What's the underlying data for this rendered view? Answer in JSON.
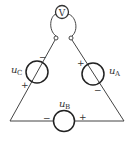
{
  "diagram": {
    "type": "circuit",
    "voltmeter": {
      "label": "V"
    },
    "sources": [
      {
        "id": "A",
        "label": "u",
        "subscript": "A",
        "plus": "+",
        "minus": "−"
      },
      {
        "id": "B",
        "label": "u",
        "subscript": "B",
        "plus": "+",
        "minus": "−"
      },
      {
        "id": "C",
        "label": "u",
        "subscript": "C",
        "plus": "+",
        "minus": "−"
      }
    ]
  }
}
